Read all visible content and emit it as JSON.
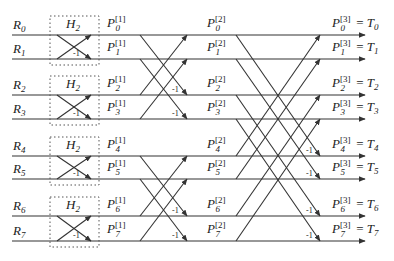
{
  "diagram": {
    "inputs": [
      "R0",
      "R1",
      "R2",
      "R3",
      "R4",
      "R5",
      "R6",
      "R7"
    ],
    "block_label": "H2",
    "stage1_labels": [
      "P0[1]",
      "P1[1]",
      "P2[1]",
      "P3[1]",
      "P4[1]",
      "P5[1]",
      "P6[1]",
      "P7[1]"
    ],
    "stage2_labels": [
      "P0[2]",
      "P1[2]",
      "P2[2]",
      "P3[2]",
      "P4[2]",
      "P5[2]",
      "P6[2]",
      "P7[2]"
    ],
    "outputs": [
      "P0[3] = T0",
      "P1[3] = T1",
      "P2[3] = T2",
      "P3[3] = T3",
      "P4[3] = T4",
      "P5[3] = T5",
      "P6[3] = T6",
      "P7[3] = T7"
    ],
    "minus_one": "-1",
    "rows_y": [
      35,
      59,
      95,
      119,
      156,
      179,
      216,
      241
    ],
    "stroke_color": "#333333"
  }
}
